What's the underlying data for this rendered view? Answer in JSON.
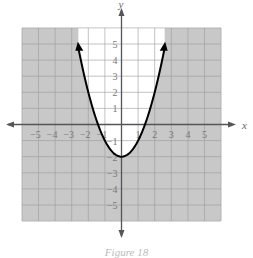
{
  "chart_data": {
    "type": "line",
    "title": "",
    "function": "y = x^2 - 2",
    "xlabel": "x",
    "ylabel": "y",
    "xlim": [
      -6,
      6
    ],
    "ylim": [
      -6,
      6
    ],
    "x_ticks": [
      -5,
      -4,
      -3,
      -2,
      -1,
      1,
      2,
      3,
      4,
      5
    ],
    "y_ticks": [
      -5,
      -4,
      -3,
      -2,
      -1,
      1,
      2,
      3,
      4,
      5
    ],
    "x_tick_labels": [
      "−5",
      "−4",
      "−3",
      "−2",
      "−1",
      "1",
      "2",
      "3",
      "4",
      "5"
    ],
    "y_tick_labels": [
      "−5",
      "−4",
      "−3",
      "−2",
      "−1",
      "1",
      "2",
      "3",
      "4",
      "5"
    ],
    "grid": true,
    "vertex": [
      0,
      -2
    ],
    "x_intercepts": [
      -1.41,
      1.41
    ],
    "points": [
      {
        "x": -2.6,
        "y": 4.76
      },
      {
        "x": -2,
        "y": 2
      },
      {
        "x": -1.5,
        "y": 0.25
      },
      {
        "x": -1,
        "y": -1
      },
      {
        "x": -0.5,
        "y": -1.75
      },
      {
        "x": 0,
        "y": -2
      },
      {
        "x": 0.5,
        "y": -1.75
      },
      {
        "x": 1,
        "y": -1
      },
      {
        "x": 1.5,
        "y": 0.25
      },
      {
        "x": 2,
        "y": 2
      },
      {
        "x": 2.6,
        "y": 4.76
      }
    ],
    "shading": "region outside the parabola (below/outside curve) shaded gray; interior above curve is white",
    "colors": {
      "shade": "#c8c8c8",
      "grid": "#9a9a9a",
      "curve": "#000000",
      "axis": "#555555",
      "interior": "#ffffff"
    }
  },
  "caption": "Figure 18"
}
